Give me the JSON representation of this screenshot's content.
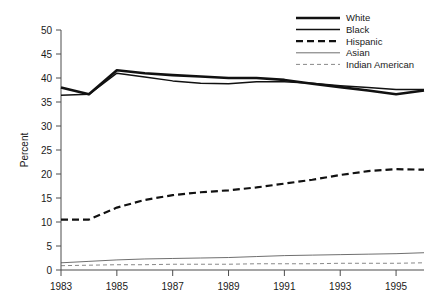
{
  "chart_data": {
    "type": "line",
    "title": "",
    "subtitle": "",
    "xlabel": "",
    "ylabel": "Percent",
    "xlim": [
      1983,
      1996
    ],
    "ylim": [
      0,
      50
    ],
    "ytick_step": 5,
    "yticks": [
      "0",
      "5",
      "10",
      "15",
      "20",
      "25",
      "30",
      "35",
      "40",
      "45",
      "50"
    ],
    "xticks": [
      "1983",
      "1985",
      "1987",
      "1989",
      "1991",
      "1993",
      "1995"
    ],
    "xtick_values": [
      1983,
      1985,
      1987,
      1989,
      1991,
      1993,
      1995
    ],
    "grid": false,
    "legend_position": "top-right",
    "x": [
      1983,
      1984,
      1985,
      1986,
      1987,
      1988,
      1989,
      1990,
      1991,
      1992,
      1993,
      1994,
      1995,
      1996
    ],
    "series": [
      {
        "name": "White",
        "style": "solid",
        "width": 2.6,
        "color": "#111111",
        "values": [
          38.0,
          36.6,
          41.6,
          41.0,
          40.6,
          40.3,
          40.0,
          40.0,
          39.6,
          38.8,
          38.1,
          37.4,
          36.6,
          37.4
        ]
      },
      {
        "name": "Black",
        "style": "solid",
        "width": 1.5,
        "color": "#111111",
        "values": [
          36.4,
          36.6,
          41.0,
          40.2,
          39.4,
          38.9,
          38.8,
          39.2,
          39.2,
          38.9,
          38.4,
          38.0,
          37.6,
          37.6
        ]
      },
      {
        "name": "Hispanic",
        "style": "dashed",
        "width": 2.2,
        "color": "#111111",
        "values": [
          10.5,
          10.5,
          13.0,
          14.6,
          15.6,
          16.2,
          16.6,
          17.2,
          18.0,
          18.8,
          19.8,
          20.6,
          21.0,
          20.9
        ]
      },
      {
        "name": "Asian",
        "style": "solid",
        "width": 0.8,
        "color": "#4a4a4a",
        "values": [
          1.5,
          1.8,
          2.1,
          2.3,
          2.4,
          2.5,
          2.6,
          2.8,
          3.0,
          3.1,
          3.2,
          3.3,
          3.4,
          3.6
        ]
      },
      {
        "name": "Indian American",
        "style": "dashed",
        "width": 0.8,
        "color": "#6a6a6a",
        "values": [
          0.9,
          1.0,
          1.1,
          1.1,
          1.2,
          1.2,
          1.2,
          1.3,
          1.3,
          1.3,
          1.4,
          1.4,
          1.4,
          1.5
        ]
      }
    ]
  },
  "legend": {
    "entries": [
      {
        "label": "White"
      },
      {
        "label": "Black"
      },
      {
        "label": "Hispanic"
      },
      {
        "label": "Asian"
      },
      {
        "label": "Indian American"
      }
    ]
  },
  "axes": {
    "y_axis_title": "Percent"
  }
}
